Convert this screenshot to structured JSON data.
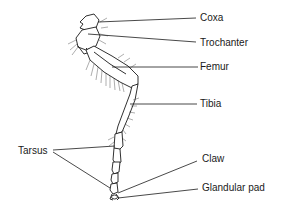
{
  "diagram": {
    "labels": {
      "coxa": "Coxa",
      "trochanter": "Trochanter",
      "femur": "Femur",
      "tibia": "Tibia",
      "tarsus": "Tarsus",
      "claw": "Claw",
      "glandular_pad": "Glandular pad"
    },
    "colors": {
      "ink": "#1a1a1a",
      "background": "#ffffff"
    }
  }
}
